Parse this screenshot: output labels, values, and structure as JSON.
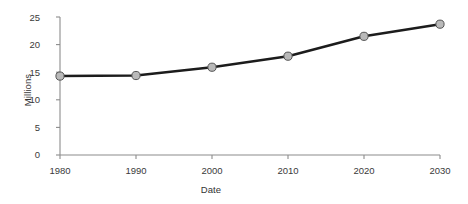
{
  "chart_data": {
    "type": "line",
    "title": "",
    "xlabel": "Date",
    "ylabel": "Millions",
    "x": [
      1980,
      1990,
      2000,
      2010,
      2020,
      2030
    ],
    "categories": [
      "1980",
      "1990",
      "2000",
      "2010",
      "2020",
      "2030"
    ],
    "values": [
      14.3,
      14.4,
      15.9,
      17.9,
      21.5,
      23.7
    ],
    "series": [
      {
        "name": "",
        "values": [
          14.3,
          14.4,
          15.9,
          17.9,
          21.5,
          23.7
        ]
      }
    ],
    "xtick_labels": [
      "1980",
      "1990",
      "2000",
      "2010",
      "2020",
      "2030"
    ],
    "ytick_labels": [
      "0",
      "5",
      "10",
      "15",
      "20",
      "25"
    ],
    "ytick_values": [
      0,
      5,
      10,
      15,
      20,
      25
    ],
    "xlim": [
      1980,
      2030
    ],
    "ylim": [
      0,
      25
    ],
    "grid": false,
    "legend": false,
    "legend_position": "none",
    "annotations": [],
    "colors": {
      "line": "#1c1c1c",
      "marker_fill": "#b9b9b9",
      "marker_edge": "#555555",
      "axis": "#8c8c8c",
      "text": "#333333",
      "background": "#ffffff"
    },
    "marker": "circle",
    "line_width": 2.6
  }
}
